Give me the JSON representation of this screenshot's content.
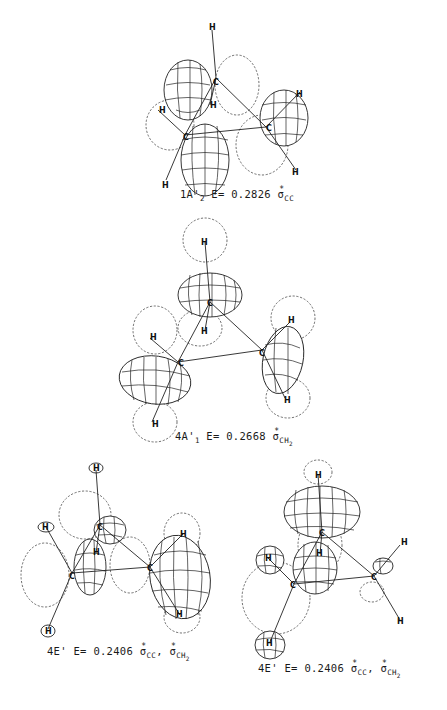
{
  "figure": {
    "panels": [
      {
        "id": "1A2",
        "state": "1A'",
        "state_sub": "2",
        "energy_label": "E=",
        "energy": "0.2826",
        "orbitals": [
          {
            "symbol": "σ",
            "sup": "*",
            "sub": "CC"
          }
        ],
        "atoms": [
          "H",
          "C",
          "H",
          "H",
          "C",
          "H",
          "C",
          "H"
        ]
      },
      {
        "id": "4A1",
        "state": "4A'",
        "state_sub": "1",
        "energy_label": "E=",
        "energy": "0.2668",
        "orbitals": [
          {
            "symbol": "σ",
            "sup": "*",
            "sub": "CH",
            "sub2": "2"
          }
        ],
        "atoms": [
          "H",
          "C",
          "H",
          "H",
          "C",
          "H",
          "C",
          "H"
        ]
      },
      {
        "id": "4E-a",
        "state": "4E'",
        "state_sub": "",
        "energy_label": "E=",
        "energy": "0.2406",
        "orbitals": [
          {
            "symbol": "σ",
            "sup": "*",
            "sub": "CC"
          },
          {
            "symbol": "σ",
            "sup": "*",
            "sub": "CH",
            "sub2": "2"
          }
        ],
        "separator": ",",
        "atoms": [
          "H",
          "C",
          "H",
          "H",
          "C",
          "H",
          "C",
          "H"
        ]
      },
      {
        "id": "4E-b",
        "state": "4E'",
        "state_sub": "",
        "energy_label": "E=",
        "energy": "0.2406",
        "orbitals": [
          {
            "symbol": "σ",
            "sup": "*",
            "sub": "CC"
          },
          {
            "symbol": "σ",
            "sup": "*",
            "sub": "CH",
            "sub2": "2"
          }
        ],
        "separator": ",",
        "atoms": [
          "H",
          "C",
          "H",
          "H",
          "C",
          "H",
          "C",
          "H"
        ]
      }
    ]
  }
}
